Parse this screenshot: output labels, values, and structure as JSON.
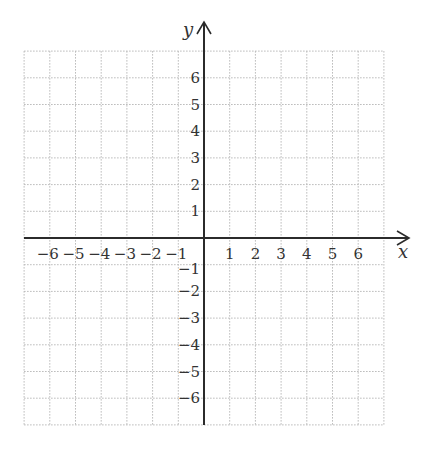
{
  "diagram": {
    "type": "coordinate-plane",
    "x_axis": {
      "label": "x",
      "min": -7,
      "max": 7,
      "tick_labels": [
        "−6",
        "−5",
        "−4",
        "−3",
        "−2",
        "−1",
        "1",
        "2",
        "3",
        "4",
        "5",
        "6"
      ],
      "tick_values": [
        -6,
        -5,
        -4,
        -3,
        -2,
        -1,
        1,
        2,
        3,
        4,
        5,
        6
      ]
    },
    "y_axis": {
      "label": "y",
      "min": -7,
      "max": 7,
      "tick_labels": [
        "6",
        "5",
        "4",
        "3",
        "2",
        "1",
        "−1",
        "−2",
        "−3",
        "−4",
        "−5",
        "−6"
      ],
      "tick_values": [
        6,
        5,
        4,
        3,
        2,
        1,
        -1,
        -2,
        -3,
        -4,
        -5,
        -6
      ]
    },
    "grid": {
      "style": "dotted",
      "spacing": 1
    },
    "colors": {
      "axis": "#2b2b2b",
      "grid": "#b8b8b8",
      "text": "#333333",
      "background": "#ffffff"
    }
  }
}
